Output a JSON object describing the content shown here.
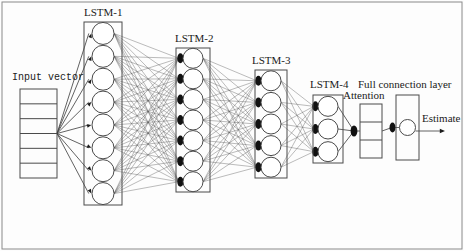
{
  "figure": {
    "background_color": "#fdfdfd",
    "stroke_color": "#4a4a4a",
    "edge_color": "#555555",
    "node_fill": "#ffffff",
    "gate_color": "#111111",
    "width": 464,
    "height": 251
  },
  "labels": {
    "input_vector": "Input vector",
    "lstm1": "LSTM-1",
    "lstm2": "LSTM-2",
    "lstm3": "LSTM-3",
    "lstm4": "LSTM-4",
    "attention": "Attention",
    "full_connection": "Full connection layer",
    "estimate": "Estimate"
  },
  "chart_data": {
    "type": "diagram",
    "layers": [
      {
        "id": "input-vector",
        "label": "Input vector",
        "kind": "vector-box",
        "cells": 6,
        "x": 20,
        "y": 89,
        "width": 37,
        "height": 89,
        "label_x": 12,
        "label_y": 80
      },
      {
        "id": "lstm-1",
        "label": "LSTM-1",
        "kind": "lstm-column",
        "nodes": 8,
        "box_x": 84,
        "box_y": 22,
        "box_width": 38,
        "box_height": 183,
        "node_radius": 11,
        "label_x": 84,
        "label_y": 16
      },
      {
        "id": "lstm-2",
        "label": "LSTM-2",
        "kind": "lstm-column",
        "nodes": 7,
        "box_x": 176,
        "box_y": 48,
        "box_width": 34,
        "box_height": 144,
        "node_radius": 10,
        "label_x": 175,
        "label_y": 42
      },
      {
        "id": "lstm-3",
        "label": "LSTM-3",
        "kind": "lstm-column",
        "nodes": 5,
        "box_x": 255,
        "box_y": 70,
        "box_width": 32,
        "box_height": 108,
        "node_radius": 10,
        "label_x": 252,
        "label_y": 64
      },
      {
        "id": "lstm-4",
        "label": "LSTM-4",
        "kind": "lstm-column",
        "nodes": 3,
        "box_x": 313,
        "box_y": 95,
        "box_width": 30,
        "box_height": 68,
        "node_radius": 10,
        "label_x": 310,
        "label_y": 88
      },
      {
        "id": "attention",
        "label": "Attention",
        "kind": "vector-box",
        "cells": 3,
        "x": 360,
        "y": 104,
        "width": 22,
        "height": 54,
        "label_x": 343,
        "label_y": 99
      },
      {
        "id": "full-connection",
        "label": "Full connection layer",
        "kind": "fc-box",
        "nodes": 1,
        "x": 396,
        "y": 95,
        "width": 23,
        "height": 65,
        "node_radius": 8,
        "label_x": 358,
        "label_y": 88
      },
      {
        "id": "estimate",
        "label": "Estimate",
        "kind": "output-arrow",
        "x": 419,
        "y": 131,
        "length": 26,
        "label_x": 422,
        "label_y": 122
      }
    ],
    "connections": [
      {
        "from": "input-vector",
        "to": "lstm-1",
        "style": "fan-out",
        "arrowheads": true
      },
      {
        "from": "lstm-1",
        "to": "lstm-2",
        "style": "fully-connected",
        "arrowheads": true
      },
      {
        "from": "lstm-2",
        "to": "lstm-3",
        "style": "fully-connected",
        "arrowheads": true
      },
      {
        "from": "lstm-3",
        "to": "lstm-4",
        "style": "fully-connected",
        "arrowheads": true
      },
      {
        "from": "lstm-4",
        "to": "attention",
        "style": "fan-in",
        "arrowheads": true
      },
      {
        "from": "attention",
        "to": "full-connection",
        "style": "single",
        "arrowheads": true
      },
      {
        "from": "full-connection",
        "to": "estimate",
        "style": "single",
        "arrowheads": true
      }
    ],
    "frame": {
      "x": 2,
      "y": 2,
      "width": 460,
      "height": 247,
      "visible": true
    }
  }
}
